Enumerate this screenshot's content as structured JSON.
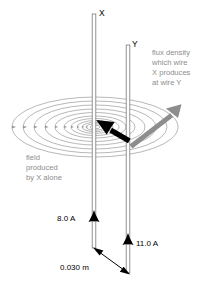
{
  "figure": {
    "type": "physics-diagram",
    "background_color": "#ffffff",
    "wires": [
      {
        "id": "X",
        "label": "X",
        "current_label": "8.0 A",
        "current_value": 8.0,
        "current_unit": "A",
        "current_direction": "up",
        "label_x": 99,
        "label_y": 16,
        "top_y": 14,
        "bottom_y": 248,
        "x": 94,
        "arrow_y": 220,
        "current_label_x": 57,
        "current_label_y": 221
      },
      {
        "id": "Y",
        "label": "Y",
        "current_label": "11.0 A",
        "current_value": 11.0,
        "current_unit": "A",
        "current_direction": "up",
        "label_x": 132,
        "label_y": 47,
        "top_y": 45,
        "bottom_y": 273,
        "x": 128,
        "arrow_y": 243,
        "current_label_x": 136,
        "current_label_y": 245
      }
    ],
    "separation": {
      "label": "0.030 m",
      "value": 0.03,
      "unit": "m",
      "label_x": 62,
      "label_y": 268
    },
    "annotations": [
      {
        "name": "field-annotation",
        "color": "#8d8d8d",
        "x": 26,
        "y": 160,
        "lines": [
          "field",
          "produced",
          "by X alone"
        ]
      },
      {
        "name": "flux-density-annotation",
        "color": "#8d8d8d",
        "x": 152,
        "y": 55,
        "lines": [
          "flux density",
          "which wire",
          "X produces",
          "at wire Y"
        ]
      }
    ],
    "field_lines": {
      "name": "concentric-field-ellipses",
      "color": "#9a9a9a",
      "center_x": 95,
      "center_y": 127,
      "count": 11,
      "radii_x": [
        83,
        72,
        61,
        50,
        40,
        31,
        24,
        18,
        13,
        9,
        5
      ],
      "radii_y": [
        30,
        26,
        22,
        18,
        14.5,
        11,
        8.5,
        6.4,
        4.6,
        3.2,
        1.8
      ]
    },
    "vectors": [
      {
        "name": "field-direction-arrow",
        "color": "#000000",
        "description": "black arrow at wire Y pointing toward wire X",
        "x1": 131,
        "y1": 142,
        "x2": 96,
        "y2": 121
      },
      {
        "name": "flux-density-vector-arrow",
        "color": "#8d8d8d",
        "description": "gray arrow from wire Y pointing up-right",
        "x1": 130,
        "y1": 142,
        "x2": 180,
        "y2": 104
      }
    ],
    "colors": {
      "wire_outline": "#7a7a7a",
      "wire_fill": "#ffffff",
      "field_line": "#9a9a9a",
      "gray_text": "#8d8d8d",
      "black": "#000000"
    }
  }
}
